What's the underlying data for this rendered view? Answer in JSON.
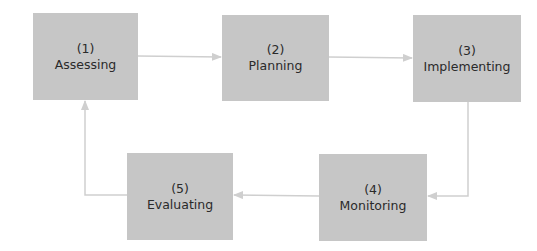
{
  "diagram": {
    "type": "process-cycle",
    "colors": {
      "box_fill": "#c6c6c6",
      "connector": "#cfcfcf",
      "text": "#2a2a2a",
      "background": "#ffffff"
    },
    "nodes": [
      {
        "id": "assessing",
        "number": "(1)",
        "label": "Assessing"
      },
      {
        "id": "planning",
        "number": "(2)",
        "label": "Planning"
      },
      {
        "id": "implementing",
        "number": "(3)",
        "label": "Implementing"
      },
      {
        "id": "monitoring",
        "number": "(4)",
        "label": "Monitoring"
      },
      {
        "id": "evaluating",
        "number": "(5)",
        "label": "Evaluating"
      }
    ],
    "edges": [
      {
        "from": "assessing",
        "to": "planning"
      },
      {
        "from": "planning",
        "to": "implementing"
      },
      {
        "from": "implementing",
        "to": "monitoring"
      },
      {
        "from": "monitoring",
        "to": "evaluating"
      },
      {
        "from": "evaluating",
        "to": "assessing"
      }
    ]
  }
}
